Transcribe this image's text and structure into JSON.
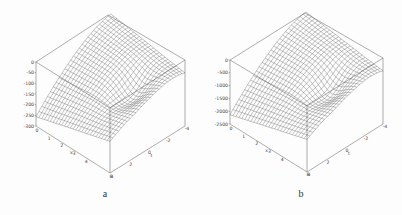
{
  "figure": {
    "panels": [
      {
        "id": "a",
        "caption": "a"
      },
      {
        "id": "b",
        "caption": "b"
      }
    ]
  },
  "chart_data": [
    {
      "type": "surface3d",
      "caption": "a",
      "zlabel": "",
      "zticks": [
        "0",
        "-50",
        "-100",
        "-150",
        "-200",
        "-250",
        "-300"
      ],
      "zlim": [
        -300,
        0
      ],
      "x_label": "x",
      "x_ticks": [
        "0",
        "1",
        "2",
        "3",
        "4",
        "6"
      ],
      "xlim": [
        0,
        6
      ],
      "t_label": "t",
      "t_ticks": [
        "4",
        "2",
        "0",
        "-2",
        "-4"
      ],
      "tlim": [
        -4,
        4
      ],
      "style": "wireframe mesh, boxed axes"
    },
    {
      "type": "surface3d",
      "caption": "b",
      "zlabel": "",
      "zticks": [
        "0",
        "-500",
        "-1000",
        "-1500",
        "-2000",
        "-2500"
      ],
      "zlim": [
        -2500,
        0
      ],
      "x_label": "x",
      "x_ticks": [
        "0",
        "1",
        "2",
        "3",
        "4",
        "6"
      ],
      "xlim": [
        0,
        6
      ],
      "t_label": "t",
      "t_ticks": [
        "4",
        "2",
        "0",
        "-2",
        "-4"
      ],
      "tlim": [
        -4,
        4
      ],
      "style": "wireframe mesh, boxed axes"
    }
  ]
}
